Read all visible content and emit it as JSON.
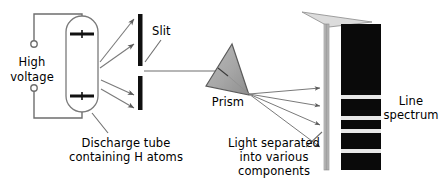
{
  "diagram": {
    "background_color": "#ffffff",
    "ink_color": "#000000",
    "wire_color": "#6e6e6e",
    "ray_color": "#7a7a7a",
    "prism_fill": "#a8a8a8",
    "prism_stroke": "#555555",
    "screen_color": "#b5b5b5",
    "spectrum_background": "#0a0a0a",
    "spectrum_line_color": "#e8e8e8",
    "labels": {
      "high_voltage_line1": "High",
      "high_voltage_line2": "voltage",
      "slit": "Slit",
      "prism": "Prism",
      "discharge_tube_line1": "Discharge tube",
      "discharge_tube_line2": "containing H atoms",
      "light_separated_line1": "Light separated",
      "light_separated_line2": "into various",
      "light_separated_line3": "components",
      "line_spectrum_line1": "Line",
      "line_spectrum_line2": "spectrum"
    },
    "components": {
      "power_supply": {
        "name": "High voltage source",
        "terminal_top": {
          "cx": 34,
          "cy": 44,
          "r": 3.2
        },
        "terminal_bottom": {
          "cx": 34,
          "cy": 88,
          "r": 3.2
        }
      },
      "discharge_tube": {
        "name": "Discharge tube containing H atoms",
        "x": 66,
        "y": 16,
        "width": 32,
        "height": 96,
        "corner_radius": 16,
        "electrodes": [
          {
            "y": 34,
            "x1": 70,
            "x2": 94
          },
          {
            "y": 96,
            "x1": 70,
            "x2": 94
          }
        ]
      },
      "slit": {
        "name": "Slit",
        "bar_x": 138,
        "bar_width": 5,
        "upper_bar": {
          "y1": 14,
          "y2": 66
        },
        "lower_bar": {
          "y1": 76,
          "y2": 110
        },
        "gap_center_y": 71
      },
      "prism": {
        "name": "Prism",
        "apex": {
          "x": 232,
          "y": 44
        },
        "left": {
          "x": 206,
          "y": 86
        },
        "right": {
          "x": 249,
          "y": 95
        }
      },
      "screen": {
        "name": "Viewing screen",
        "x": 324,
        "y": 24,
        "width": 5,
        "height": 146
      },
      "spectrum_plate": {
        "name": "Line spectrum plate",
        "x": 341,
        "y": 24,
        "width": 40,
        "height": 146,
        "lines": [
          {
            "y": 97,
            "thickness": 4
          },
          {
            "y": 118,
            "thickness": 4
          },
          {
            "y": 131,
            "thickness": 4
          },
          {
            "y": 151,
            "thickness": 4
          }
        ]
      }
    },
    "rays": {
      "tube_to_slit": [
        {
          "x1": 100,
          "y1": 62,
          "x2": 136,
          "y2": 19
        },
        {
          "x1": 100,
          "y1": 68,
          "x2": 136,
          "y2": 43
        },
        {
          "x1": 101,
          "y1": 80,
          "x2": 136,
          "y2": 96
        },
        {
          "x1": 101,
          "y1": 88,
          "x2": 136,
          "y2": 108
        }
      ],
      "slit_to_prism": {
        "x1": 144,
        "y1": 71,
        "x2": 218,
        "y2": 71
      },
      "prism_to_screen": [
        {
          "x1": 249,
          "y1": 94,
          "x2": 322,
          "y2": 88
        },
        {
          "x1": 249,
          "y1": 94,
          "x2": 322,
          "y2": 105
        },
        {
          "x1": 249,
          "y1": 94,
          "x2": 322,
          "y2": 124
        },
        {
          "x1": 249,
          "y1": 94,
          "x2": 322,
          "y2": 146
        }
      ]
    }
  }
}
